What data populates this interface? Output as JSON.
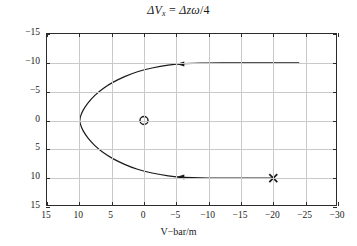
{
  "title": {
    "full": "ΔV_x = Δzω/4",
    "delta": "Δ",
    "v": "V",
    "v_sub": "x",
    "equals": "=",
    "rhs_delta": "Δ",
    "rhs_z": "z",
    "rhs_omega": "ω",
    "rhs_div": "/4"
  },
  "axes": {
    "x_title": "V−bar/m",
    "y_title": "R−bar/m"
  },
  "colors": {
    "curve": "#1a1a1a",
    "grid": "#c9c9c9",
    "frame": "#2b2b2b",
    "background": "#ffffff",
    "text": "#1a1a1a"
  },
  "chart_data": {
    "type": "line",
    "xlabel": "V−bar/m",
    "ylabel": "R−bar/m",
    "xlim": [
      15,
      -30
    ],
    "ylim": [
      -15,
      15
    ],
    "x_ticks": [
      15,
      10,
      5,
      0,
      -5,
      -10,
      -15,
      -20,
      -25,
      -30
    ],
    "y_ticks": [
      -15,
      -10,
      -5,
      0,
      5,
      10,
      15
    ],
    "x_tick_labels": [
      "15",
      "10",
      "5",
      "0",
      "−5",
      "−10",
      "−15",
      "−20",
      "−25",
      "−30"
    ],
    "y_tick_labels": [
      "−15",
      "−10",
      "−5",
      "0",
      "5",
      "10",
      "15"
    ],
    "x_axis_inverted": true,
    "y_axis_inverted": true,
    "grid": true,
    "legend": "none",
    "series": [
      {
        "name": "transfer-trajectory",
        "style": "solid",
        "color": "#1a1a1a",
        "points": [
          [
            -20.0,
            10.0
          ],
          [
            -17.5,
            10.0
          ],
          [
            -15.0,
            10.0
          ],
          [
            -12.5,
            10.0
          ],
          [
            -10.0,
            10.0
          ],
          [
            -7.5,
            9.9
          ],
          [
            -5.0,
            9.8
          ],
          [
            -2.5,
            9.4
          ],
          [
            0.0,
            8.8
          ],
          [
            2.0,
            8.1
          ],
          [
            4.0,
            7.1
          ],
          [
            5.5,
            6.2
          ],
          [
            7.0,
            5.0
          ],
          [
            8.2,
            3.7
          ],
          [
            9.1,
            2.4
          ],
          [
            9.7,
            1.2
          ],
          [
            10.0,
            0.0
          ],
          [
            9.7,
            -1.2
          ],
          [
            9.1,
            -2.4
          ],
          [
            8.2,
            -3.7
          ],
          [
            7.0,
            -5.0
          ],
          [
            5.5,
            -6.2
          ],
          [
            4.0,
            -7.1
          ],
          [
            2.0,
            -8.1
          ],
          [
            0.0,
            -8.8
          ],
          [
            -2.5,
            -9.4
          ],
          [
            -5.0,
            -9.8
          ],
          [
            -7.5,
            -9.9
          ],
          [
            -10.0,
            -10.0
          ],
          [
            -14.0,
            -10.0
          ],
          [
            -18.0,
            -10.0
          ],
          [
            -22.0,
            -10.0
          ],
          [
            -24.0,
            -10.0
          ]
        ]
      }
    ],
    "markers": [
      {
        "name": "origin-marker",
        "symbol": "o",
        "x": 0.0,
        "y": 0.0
      },
      {
        "name": "start-marker",
        "symbol": "x",
        "x": -20.0,
        "y": 10.0
      }
    ],
    "annotations": [
      {
        "name": "arrow-lower",
        "symbol": "arrowhead",
        "x": -5.0,
        "y": 9.8,
        "direction": "left"
      },
      {
        "name": "arrow-upper",
        "symbol": "arrowhead",
        "x": -5.0,
        "y": -9.8,
        "direction": "left"
      }
    ]
  }
}
